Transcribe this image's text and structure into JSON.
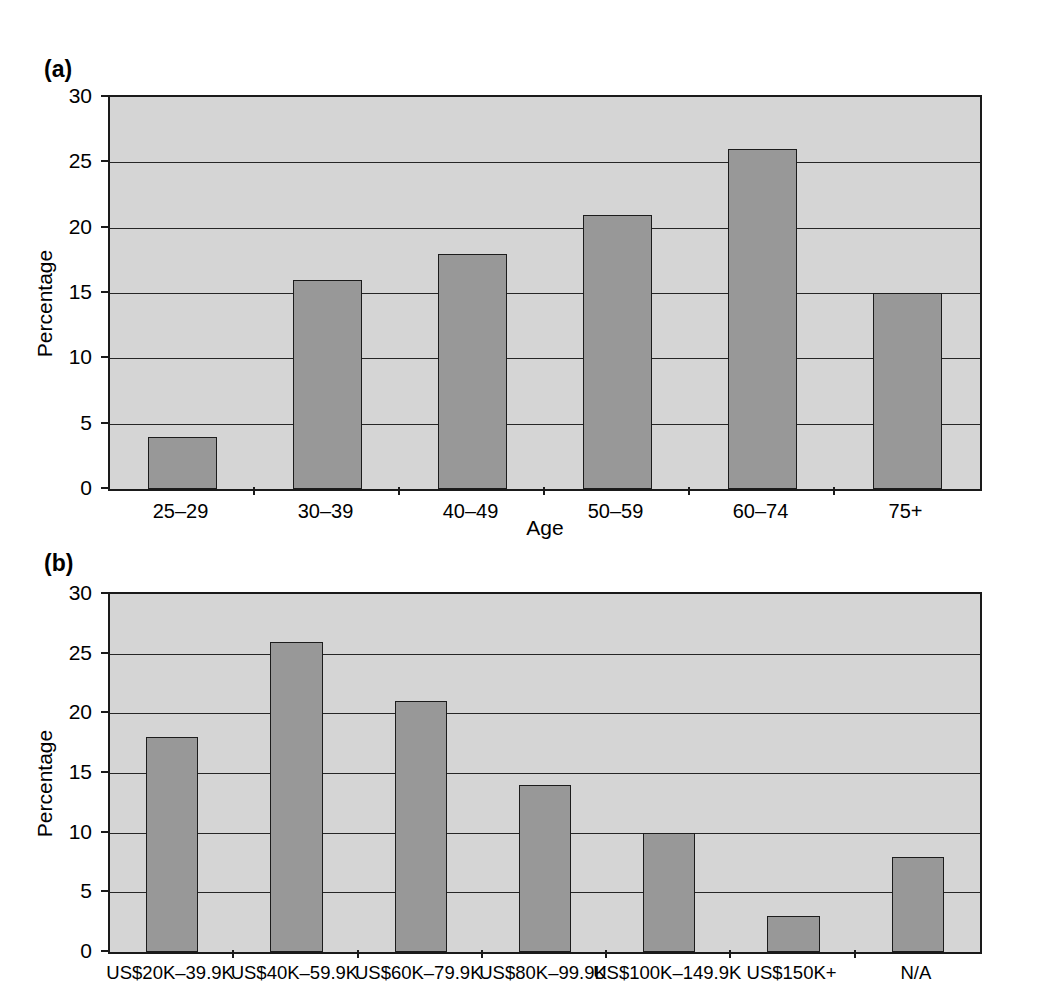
{
  "figure": {
    "panels": [
      {
        "key": "a",
        "label": "(a)",
        "ylabel": "Percentage",
        "xlabel": "Age"
      },
      {
        "key": "b",
        "label": "(b)",
        "ylabel": "Percentage",
        "xlabel": ""
      }
    ]
  },
  "chart_data": [
    {
      "type": "bar",
      "panel": "(a)",
      "title": "",
      "xlabel": "Age",
      "ylabel": "Percentage",
      "categories": [
        "25–29",
        "30–39",
        "40–49",
        "50–59",
        "60–74",
        "75+"
      ],
      "values": [
        4,
        16,
        18,
        21,
        26,
        15
      ],
      "ylim": [
        0,
        30
      ],
      "yticks": [
        0,
        5,
        10,
        15,
        20,
        25,
        30
      ],
      "ytick_labels": [
        "0",
        "5",
        "10",
        "15",
        "20",
        "25",
        "30"
      ],
      "grid": "horizontal",
      "legend": "none",
      "colors": {
        "bar_fill": "#989898",
        "bar_stroke": "#1c1c1c",
        "plot_background": "#d5d5d5",
        "gridline": "#262626",
        "axis": "#1a1a1a",
        "text": "#000000"
      }
    },
    {
      "type": "bar",
      "panel": "(b)",
      "title": "",
      "xlabel": "",
      "ylabel": "Percentage",
      "categories": [
        "US$20K–39.9K",
        "US$40K–59.9K",
        "US$60K–79.9K",
        "US$80K–99.9K",
        "US$100K–149.9K",
        "US$150K+",
        "N/A"
      ],
      "values": [
        18,
        26,
        21,
        14,
        10,
        3,
        8
      ],
      "ylim": [
        0,
        30
      ],
      "yticks": [
        0,
        5,
        10,
        15,
        20,
        25,
        30
      ],
      "ytick_labels": [
        "0",
        "5",
        "10",
        "15",
        "20",
        "25",
        "30"
      ],
      "grid": "horizontal",
      "legend": "none",
      "colors": {
        "bar_fill": "#989898",
        "bar_stroke": "#1c1c1c",
        "plot_background": "#d5d5d5",
        "gridline": "#262626",
        "axis": "#1a1a1a",
        "text": "#000000"
      }
    }
  ]
}
